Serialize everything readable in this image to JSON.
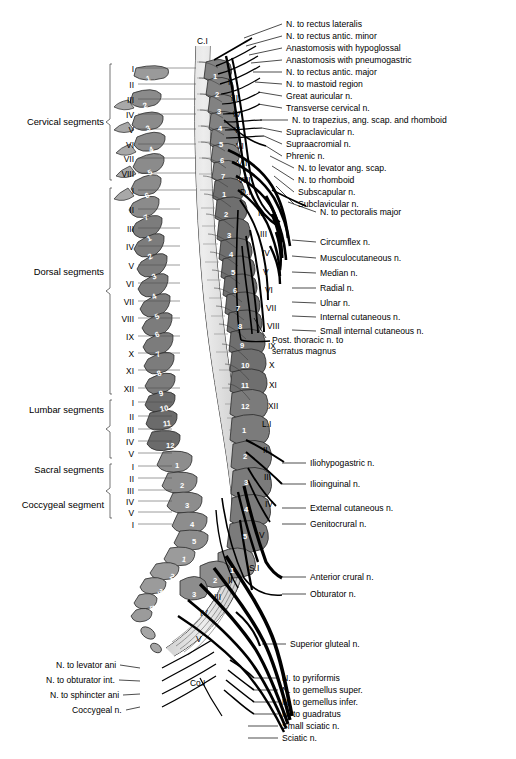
{
  "figure": {
    "colors": {
      "ink": "#000000",
      "vertebra_fill_dark": "#6f6f6f",
      "vertebra_fill_mid": "#8d8d8d",
      "vertebra_fill_light": "#b5b5b5",
      "cord_fill": "#d9d9d9",
      "background": "#ffffff",
      "leader_line": "#000000"
    }
  },
  "segment_groups": [
    {
      "name": "Cervical segments",
      "y": 122,
      "levels": [
        "I",
        "II",
        "III",
        "IV",
        "V",
        "VI",
        "VII",
        "VIII"
      ]
    },
    {
      "name": "Dorsal segments",
      "y": 272,
      "levels": [
        "I",
        "II",
        "III",
        "IV",
        "V",
        "VI",
        "VII",
        "VIII",
        "IX",
        "X",
        "XI",
        "XII"
      ]
    },
    {
      "name": "Lumbar segments",
      "y": 410,
      "levels": [
        "I",
        "II",
        "III",
        "IV",
        "V"
      ]
    },
    {
      "name": "Sacral segments",
      "y": 470,
      "levels": [
        "I",
        "II",
        "III",
        "IV",
        "V"
      ]
    },
    {
      "name": "Coccygeal segment",
      "y": 505,
      "levels": [
        "I"
      ]
    }
  ],
  "left_segment_ticks": [
    {
      "label": "I",
      "y": 70
    },
    {
      "label": "II",
      "y": 86
    },
    {
      "label": "III",
      "y": 101
    },
    {
      "label": "IV",
      "y": 116
    },
    {
      "label": "V",
      "y": 131
    },
    {
      "label": "VI",
      "y": 146
    },
    {
      "label": "VII",
      "y": 160
    },
    {
      "label": "VIII",
      "y": 175
    },
    {
      "label": "I",
      "y": 192
    },
    {
      "label": "II",
      "y": 211
    },
    {
      "label": "III",
      "y": 230
    },
    {
      "label": "IV",
      "y": 248
    },
    {
      "label": "V",
      "y": 267
    },
    {
      "label": "VI",
      "y": 285
    },
    {
      "label": "VII",
      "y": 303
    },
    {
      "label": "VIII",
      "y": 320
    },
    {
      "label": "IX",
      "y": 338
    },
    {
      "label": "X",
      "y": 355
    },
    {
      "label": "XI",
      "y": 372
    },
    {
      "label": "XII",
      "y": 390
    },
    {
      "label": "I",
      "y": 404
    },
    {
      "label": "II",
      "y": 418
    },
    {
      "label": "III",
      "y": 431
    },
    {
      "label": "IV",
      "y": 443
    },
    {
      "label": "V",
      "y": 455
    },
    {
      "label": "I",
      "y": 468
    },
    {
      "label": "II",
      "y": 480
    },
    {
      "label": "III",
      "y": 492
    },
    {
      "label": "IV",
      "y": 503
    },
    {
      "label": "V",
      "y": 514
    },
    {
      "label": "I",
      "y": 526
    }
  ],
  "vertebra_column_left": [
    {
      "num": "1",
      "x": 146,
      "y": 74,
      "rot": -18
    },
    {
      "num": "2",
      "x": 143,
      "y": 101,
      "rot": -20
    },
    {
      "num": "3",
      "x": 146,
      "y": 124,
      "rot": -22
    },
    {
      "num": "4",
      "x": 149,
      "y": 145,
      "rot": -24
    },
    {
      "num": "5",
      "x": 148,
      "y": 168,
      "rot": -26
    },
    {
      "num": "6",
      "x": 145,
      "y": 191,
      "rot": -26
    },
    {
      "num": "7",
      "x": 144,
      "y": 213,
      "rot": -26
    },
    {
      "num": "1",
      "x": 147,
      "y": 234,
      "rot": -26
    },
    {
      "num": "2",
      "x": 148,
      "y": 252,
      "rot": -26
    },
    {
      "num": "3",
      "x": 152,
      "y": 272,
      "rot": -26
    },
    {
      "num": "4",
      "x": 152,
      "y": 292,
      "rot": -26
    },
    {
      "num": "5",
      "x": 155,
      "y": 312,
      "rot": -26
    },
    {
      "num": "6",
      "x": 155,
      "y": 330,
      "rot": -24
    },
    {
      "num": "7",
      "x": 156,
      "y": 350,
      "rot": -22
    },
    {
      "num": "8",
      "x": 157,
      "y": 369,
      "rot": -20
    },
    {
      "num": "9",
      "x": 159,
      "y": 389,
      "rot": -16
    },
    {
      "num": "10",
      "x": 160,
      "y": 404,
      "rot": -12
    },
    {
      "num": "11",
      "x": 163,
      "y": 419,
      "rot": -6
    },
    {
      "num": "12",
      "x": 166,
      "y": 441,
      "rot": 0
    },
    {
      "num": "1",
      "x": 175,
      "y": 461,
      "rot": 0
    },
    {
      "num": "2",
      "x": 180,
      "y": 481,
      "rot": 0
    },
    {
      "num": "3",
      "x": 185,
      "y": 501,
      "rot": 0
    },
    {
      "num": "4",
      "x": 190,
      "y": 520,
      "rot": 0
    },
    {
      "num": "5",
      "x": 192,
      "y": 537,
      "rot": 0
    },
    {
      "num": "1",
      "x": 182,
      "y": 555,
      "rot": 10
    },
    {
      "num": "2",
      "x": 170,
      "y": 572,
      "rot": 22
    },
    {
      "num": "3",
      "x": 158,
      "y": 587,
      "rot": 34
    },
    {
      "num": "4",
      "x": 150,
      "y": 603,
      "rot": 44
    },
    {
      "num": "5",
      "x": 146,
      "y": 618,
      "rot": 52
    }
  ],
  "vertebra_column_right": [
    {
      "num": "1",
      "x": 213,
      "y": 72
    },
    {
      "num": "2",
      "x": 215,
      "y": 90
    },
    {
      "num": "3",
      "x": 217,
      "y": 107
    },
    {
      "num": "4",
      "x": 218,
      "y": 124
    },
    {
      "num": "5",
      "x": 219,
      "y": 140
    },
    {
      "num": "6",
      "x": 220,
      "y": 156
    },
    {
      "num": "7",
      "x": 221,
      "y": 172
    },
    {
      "num": "1",
      "x": 222,
      "y": 190
    },
    {
      "num": "2",
      "x": 224,
      "y": 210
    },
    {
      "num": "3",
      "x": 227,
      "y": 231
    },
    {
      "num": "4",
      "x": 229,
      "y": 250
    },
    {
      "num": "5",
      "x": 231,
      "y": 268
    },
    {
      "num": "6",
      "x": 233,
      "y": 286
    },
    {
      "num": "7",
      "x": 236,
      "y": 304
    },
    {
      "num": "8",
      "x": 238,
      "y": 322
    },
    {
      "num": "9",
      "x": 240,
      "y": 341
    },
    {
      "num": "10",
      "x": 241,
      "y": 361
    },
    {
      "num": "11",
      "x": 241,
      "y": 381
    },
    {
      "num": "12",
      "x": 241,
      "y": 402
    },
    {
      "num": "1",
      "x": 242,
      "y": 426
    },
    {
      "num": "2",
      "x": 243,
      "y": 452
    },
    {
      "num": "3",
      "x": 244,
      "y": 478
    },
    {
      "num": "4",
      "x": 244,
      "y": 505
    },
    {
      "num": "5",
      "x": 243,
      "y": 532
    },
    {
      "num": "1",
      "x": 230,
      "y": 566
    },
    {
      "num": "2",
      "x": 213,
      "y": 576
    },
    {
      "num": "3",
      "x": 192,
      "y": 590
    }
  ],
  "right_roman_ticks": [
    {
      "label": "C.I",
      "x": 197,
      "y": 41
    },
    {
      "label": "II",
      "x": 228,
      "y": 82
    },
    {
      "label": "III",
      "x": 231,
      "y": 98
    },
    {
      "label": "IV",
      "x": 233,
      "y": 114
    },
    {
      "label": "V",
      "x": 234,
      "y": 130
    },
    {
      "label": "VI",
      "x": 236,
      "y": 146
    },
    {
      "label": "VII",
      "x": 237,
      "y": 163
    },
    {
      "label": "VIII",
      "x": 238,
      "y": 180
    },
    {
      "label": "D.I",
      "x": 240,
      "y": 192
    },
    {
      "label": "II",
      "x": 258,
      "y": 213
    },
    {
      "label": "III",
      "x": 260,
      "y": 234
    },
    {
      "label": "IV",
      "x": 262,
      "y": 253
    },
    {
      "label": "V",
      "x": 263,
      "y": 272
    },
    {
      "label": "VI",
      "x": 265,
      "y": 290
    },
    {
      "label": "VII",
      "x": 266,
      "y": 308
    },
    {
      "label": "VIII",
      "x": 267,
      "y": 326
    },
    {
      "label": "IX",
      "x": 268,
      "y": 346
    },
    {
      "label": "X",
      "x": 269,
      "y": 365
    },
    {
      "label": "XI",
      "x": 269,
      "y": 385
    },
    {
      "label": "XII",
      "x": 268,
      "y": 406
    },
    {
      "label": "L.I",
      "x": 262,
      "y": 424
    },
    {
      "label": "II",
      "x": 263,
      "y": 450
    },
    {
      "label": "III",
      "x": 264,
      "y": 477
    },
    {
      "label": "IV",
      "x": 265,
      "y": 504
    },
    {
      "label": "V",
      "x": 259,
      "y": 535
    },
    {
      "label": "S.I",
      "x": 249,
      "y": 568
    },
    {
      "label": "II",
      "x": 228,
      "y": 580
    },
    {
      "label": "III",
      "x": 214,
      "y": 597
    },
    {
      "label": "IV",
      "x": 200,
      "y": 613
    },
    {
      "label": "V",
      "x": 196,
      "y": 639
    },
    {
      "label": "Co.I",
      "x": 190,
      "y": 683
    }
  ],
  "right_labels": [
    {
      "text": "N. to rectus lateralis",
      "x": 286,
      "y": 24,
      "ax": 244,
      "ay": 38
    },
    {
      "text": "N. to rectus antic. minor",
      "x": 286,
      "y": 36,
      "ax": 246,
      "ay": 46
    },
    {
      "text": "Anastomosis with hypoglossal",
      "x": 286,
      "y": 48,
      "ax": 249,
      "ay": 55
    },
    {
      "text": "Anastomosis with pneumogastric",
      "x": 286,
      "y": 60,
      "ax": 251,
      "ay": 63
    },
    {
      "text": "N. to rectus antic. major",
      "x": 286,
      "y": 72,
      "ax": 253,
      "ay": 72
    },
    {
      "text": "N. to mastoid region",
      "x": 286,
      "y": 84,
      "ax": 255,
      "ay": 82
    },
    {
      "text": "Great auricular n.",
      "x": 286,
      "y": 96,
      "ax": 258,
      "ay": 92
    },
    {
      "text": "Transverse cervical n.",
      "x": 286,
      "y": 108,
      "ax": 258,
      "ay": 104
    },
    {
      "text": "N. to trapezius, ang. scap. and rhomboid",
      "x": 292,
      "y": 120,
      "ax": 260,
      "ay": 120
    },
    {
      "text": "Supraclavicular n.",
      "x": 286,
      "y": 132,
      "ax": 262,
      "ay": 128
    },
    {
      "text": "Supraacromial n.",
      "x": 286,
      "y": 144,
      "ax": 264,
      "ay": 136
    },
    {
      "text": "Phrenic n.",
      "x": 286,
      "y": 156,
      "ax": 266,
      "ay": 146
    },
    {
      "text": "N. to levator ang. scap.",
      "x": 298,
      "y": 168,
      "ax": 270,
      "ay": 156
    },
    {
      "text": "N. to rhomboid",
      "x": 298,
      "y": 180,
      "ax": 272,
      "ay": 166
    },
    {
      "text": "Subscapular n.",
      "x": 298,
      "y": 192,
      "ax": 274,
      "ay": 176
    },
    {
      "text": "Subclavicular n.",
      "x": 298,
      "y": 204,
      "ax": 276,
      "ay": 186
    },
    {
      "text": "N. to pectoralis major",
      "x": 320,
      "y": 212,
      "ax": 288,
      "ay": 202
    },
    {
      "text": "Circumflex n.",
      "x": 320,
      "y": 242,
      "ax": 292,
      "ay": 240
    },
    {
      "text": "Musculocutaneous n.",
      "x": 320,
      "y": 258,
      "ax": 292,
      "ay": 256
    },
    {
      "text": "Median n.",
      "x": 320,
      "y": 273,
      "ax": 292,
      "ay": 272
    },
    {
      "text": "Radial n.",
      "x": 320,
      "y": 288,
      "ax": 292,
      "ay": 288
    },
    {
      "text": "Ulnar n.",
      "x": 320,
      "y": 303,
      "ax": 292,
      "ay": 302
    },
    {
      "text": "Internal cutaneous n.",
      "x": 320,
      "y": 317,
      "ax": 292,
      "ay": 316
    },
    {
      "text": "Small internal cutaneous n.",
      "x": 320,
      "y": 331,
      "ax": 292,
      "ay": 330
    },
    {
      "text": "Iliohypogastric n.",
      "x": 310,
      "y": 463,
      "ax": 282,
      "ay": 463
    },
    {
      "text": "Ilioinguinal n.",
      "x": 310,
      "y": 484,
      "ax": 282,
      "ay": 484
    },
    {
      "text": "External cutaneous n.",
      "x": 310,
      "y": 508,
      "ax": 282,
      "ay": 508
    },
    {
      "text": "Genitocrural n.",
      "x": 310,
      "y": 524,
      "ax": 282,
      "ay": 524
    },
    {
      "text": "Anterior crural n.",
      "x": 310,
      "y": 577,
      "ax": 282,
      "ay": 577
    },
    {
      "text": "Obturator n.",
      "x": 310,
      "y": 594,
      "ax": 282,
      "ay": 594
    },
    {
      "text": "Superior gluteal n.",
      "x": 290,
      "y": 644,
      "ax": 262,
      "ay": 644
    },
    {
      "text": "N. to pyriformis",
      "x": 282,
      "y": 678,
      "ax": 254,
      "ay": 678
    },
    {
      "text": "N. to gemellus super.",
      "x": 282,
      "y": 690,
      "ax": 254,
      "ay": 690
    },
    {
      "text": "N. to gemellus infer.",
      "x": 282,
      "y": 702,
      "ax": 254,
      "ay": 702
    },
    {
      "text": "N. to guadratus",
      "x": 282,
      "y": 714,
      "ax": 254,
      "ay": 714
    },
    {
      "text": "Small sciatic n.",
      "x": 282,
      "y": 726,
      "ax": 248,
      "ay": 726
    },
    {
      "text": "Sciatic n.",
      "x": 282,
      "y": 738,
      "ax": 248,
      "ay": 738
    }
  ],
  "right_labels_multiline": [
    {
      "line1": "Post. thoracic n. to",
      "line2": "serratus magnus",
      "x": 272,
      "y": 340
    }
  ],
  "left_labels": [
    {
      "text": "N. to levator ani",
      "x": 56,
      "y": 665,
      "ax": 140,
      "ay": 668
    },
    {
      "text": "N. to obturator int.",
      "x": 46,
      "y": 680,
      "ax": 140,
      "ay": 681
    },
    {
      "text": "N. to sphincter ani",
      "x": 50,
      "y": 695,
      "ax": 140,
      "ay": 694
    },
    {
      "text": "Coccygeal n.",
      "x": 72,
      "y": 710,
      "ax": 140,
      "ay": 707
    }
  ]
}
